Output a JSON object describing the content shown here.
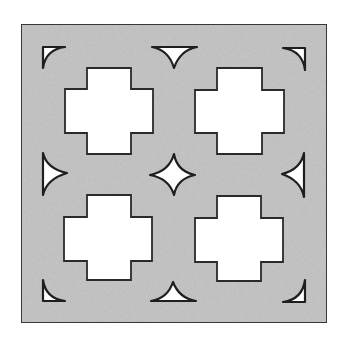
{
  "figure": {
    "title": "",
    "colors": {
      "background": "#ffffff",
      "panel_fill": "#c9c9c9",
      "panel_stroke": "#3a3a3a",
      "hole_fill": "#ffffff",
      "hole_stroke": "#2a2a2a"
    },
    "panel": {
      "x": 21,
      "y": 24,
      "width": 306,
      "height": 299
    },
    "crosses": [
      {
        "name": "top-left",
        "vbar": [
          87,
          68,
          131,
          154
        ],
        "hbar": [
          65,
          89,
          153,
          133
        ]
      },
      {
        "name": "top-right",
        "vbar": [
          217,
          68,
          262,
          154
        ],
        "hbar": [
          195,
          90,
          284,
          133
        ]
      },
      {
        "name": "bottom-left",
        "vbar": [
          87,
          195,
          131,
          280
        ],
        "hbar": [
          64,
          217,
          152,
          261
        ]
      },
      {
        "name": "bottom-right",
        "vbar": [
          217,
          196,
          261,
          281
        ],
        "hbar": [
          195,
          218,
          283,
          262
        ]
      }
    ],
    "star": {
      "cx": 173,
      "cy": 175,
      "tips": {
        "top": [
          174,
          154
        ],
        "right": [
          195,
          175
        ],
        "bottom": [
          174,
          195
        ],
        "left": [
          150,
          175
        ]
      }
    },
    "edge_shapes": [
      {
        "name": "top",
        "points": [
          [
            152,
            47
          ],
          [
            197,
            47
          ],
          [
            174,
            68
          ]
        ]
      },
      {
        "name": "bottom",
        "points": [
          [
            151,
            301
          ],
          [
            196,
            301
          ],
          [
            173,
            282
          ]
        ]
      },
      {
        "name": "left",
        "points": [
          [
            43,
            153
          ],
          [
            43,
            195
          ],
          [
            67,
            173
          ]
        ]
      },
      {
        "name": "right",
        "points": [
          [
            304,
            153
          ],
          [
            304,
            197
          ],
          [
            282,
            174
          ]
        ]
      }
    ],
    "corner_shapes": [
      {
        "name": "top-left",
        "corner": [
          43,
          47
        ],
        "h_end": [
          65,
          47
        ],
        "v_end": [
          43,
          68
        ]
      },
      {
        "name": "top-right",
        "corner": [
          305,
          48
        ],
        "h_end": [
          283,
          48
        ],
        "v_end": [
          305,
          70
        ]
      },
      {
        "name": "bottom-left",
        "corner": [
          43,
          301
        ],
        "h_end": [
          65,
          301
        ],
        "v_end": [
          43,
          280
        ]
      },
      {
        "name": "bottom-right",
        "corner": [
          305,
          302
        ],
        "h_end": [
          283,
          302
        ],
        "v_end": [
          305,
          280
        ]
      }
    ]
  }
}
